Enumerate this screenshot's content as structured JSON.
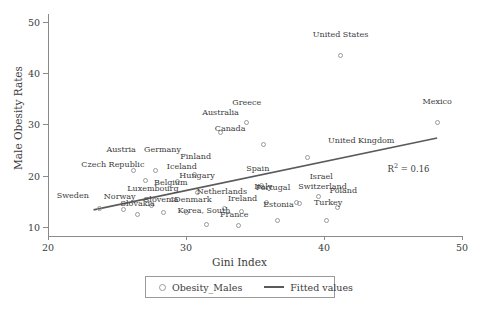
{
  "chart_data": {
    "type": "scatter",
    "title": "",
    "xlabel": "Gini Index",
    "ylabel": "Male Obesity Rates",
    "xlim": [
      20,
      50
    ],
    "ylim": [
      8.2,
      51.5
    ],
    "xticks": [
      20,
      30,
      40,
      50
    ],
    "yticks": [
      10,
      20,
      30,
      40,
      50
    ],
    "grid": false,
    "annotation": {
      "r2_prefix": "R",
      "r2_exponent": "2",
      "r2_value": " = 0.16",
      "x": 44.6,
      "y": 22.6
    },
    "series": [
      {
        "name": "Obesity_Males",
        "type": "scatter",
        "marker": "open-circle",
        "color": "#9a9a9a",
        "points": [
          {
            "label": "United States",
            "x": 41.2,
            "y": 43.5,
            "lx": 0,
            "ly": 3.1
          },
          {
            "label": "Mexico",
            "x": 48.2,
            "y": 30.4,
            "lx": 0,
            "ly": 3.1
          },
          {
            "label": "Greece",
            "x": 34.4,
            "y": 30.3,
            "lx": 0,
            "ly": 3.1
          },
          {
            "label": "Australia",
            "x": 32.5,
            "y": 28.4,
            "lx": 0,
            "ly": 3.1
          },
          {
            "label": "Canada",
            "x": 35.6,
            "y": 26.1,
            "lx": -2.4,
            "ly": 2.2
          },
          {
            "label": "United Kingdom",
            "x": 38.8,
            "y": 23.6,
            "lx": 3.9,
            "ly": 2.3
          },
          {
            "label": "Austria",
            "x": 26.2,
            "y": 20.9,
            "lx": -0.9,
            "ly": 3.3
          },
          {
            "label": "Germany",
            "x": 27.8,
            "y": 20.9,
            "lx": 0.5,
            "ly": 3.3
          },
          {
            "label": "Finland",
            "x": 30.6,
            "y": 20.2,
            "lx": 0.1,
            "ly": 2.6
          },
          {
            "label": "Czech Republic",
            "x": 27.1,
            "y": 19.0,
            "lx": -2.4,
            "ly": 2.2
          },
          {
            "label": "Iceland",
            "x": 29.4,
            "y": 18.9,
            "lx": 0.3,
            "ly": 1.9
          },
          {
            "label": "Spain",
            "x": 35.5,
            "y": 18.1,
            "lx": -0.3,
            "ly": 2.4
          },
          {
            "label": "Hungary",
            "x": 30.8,
            "y": 16.7,
            "lx": 0.0,
            "ly": 2.5
          },
          {
            "label": "Belgium",
            "x": 29.0,
            "y": 15.4,
            "lx": -0.1,
            "ly": 2.4
          },
          {
            "label": "Italy",
            "x": 35.8,
            "y": 14.7,
            "lx": -0.2,
            "ly": 2.2
          },
          {
            "label": "Switzerland",
            "x": 38.0,
            "y": 14.8,
            "lx": 1.9,
            "ly": 2.2
          },
          {
            "label": "Israel",
            "x": 39.6,
            "y": 16.0,
            "lx": 0.2,
            "ly": 2.9
          },
          {
            "label": "Portugal",
            "x": 38.2,
            "y": 14.6,
            "lx": -1.9,
            "ly": 2.2
          },
          {
            "label": "Poland",
            "x": 41.0,
            "y": 13.7,
            "lx": 0.4,
            "ly": 2.4
          },
          {
            "label": "Netherlands",
            "x": 32.8,
            "y": 13.6,
            "lx": -0.2,
            "ly": 2.4
          },
          {
            "label": "Luxembourg",
            "x": 27.5,
            "y": 14.2,
            "lx": 0.1,
            "ly": 2.3
          },
          {
            "label": "Sweden",
            "x": 23.7,
            "y": 13.6,
            "lx": -1.9,
            "ly": 1.7
          },
          {
            "label": "Norway",
            "x": 25.5,
            "y": 13.4,
            "lx": -0.3,
            "ly": 1.7
          },
          {
            "label": "Denmark",
            "x": 30.0,
            "y": 12.7,
            "lx": 0.5,
            "ly": 1.8
          },
          {
            "label": "Slovenia",
            "x": 28.4,
            "y": 12.7,
            "lx": -0.2,
            "ly": 1.8
          },
          {
            "label": "Ireland",
            "x": 34.0,
            "y": 12.9,
            "lx": 0.1,
            "ly": 1.8
          },
          {
            "label": "Slovakia",
            "x": 26.5,
            "y": 12.3,
            "lx": 0.0,
            "ly": 1.3
          },
          {
            "label": "Turkey",
            "x": 40.2,
            "y": 11.2,
            "lx": 0.1,
            "ly": 2.6
          },
          {
            "label": "Estonia",
            "x": 36.6,
            "y": 11.3,
            "lx": 0.1,
            "ly": 2.1
          },
          {
            "label": "Korea, South",
            "x": 31.5,
            "y": 10.5,
            "lx": -0.2,
            "ly": 1.8
          },
          {
            "label": "France",
            "x": 33.8,
            "y": 10.3,
            "lx": -0.3,
            "ly": 1.2
          }
        ]
      },
      {
        "name": "Fitted values",
        "type": "line",
        "color": "#5a5a5a",
        "endpoints": [
          {
            "x": 23.3,
            "y": 13.3
          },
          {
            "x": 48.2,
            "y": 27.3
          }
        ]
      }
    ],
    "legend": {
      "position": "bottom",
      "entries": [
        {
          "label": "Obesity_Males",
          "marker": "open-circle"
        },
        {
          "label": "Fitted values",
          "marker": "line"
        }
      ]
    }
  }
}
